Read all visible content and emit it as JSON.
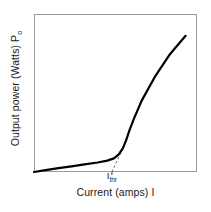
{
  "chart_data": {
    "type": "line",
    "title": "",
    "xlabel": "Current (amps) I",
    "ylabel_main": "Output power (Watts) P",
    "ylabel_sub": "o",
    "grid": false,
    "legend": null,
    "xlim": [
      0,
      1
    ],
    "ylim": [
      0,
      1
    ],
    "tick_labels": {
      "x": [],
      "y": []
    },
    "annotations": [
      {
        "name": "threshold-current",
        "text_main": "I",
        "text_sub": "thr",
        "x_norm": 0.478,
        "style": "dashed-extrapolation-to-x-axis"
      }
    ],
    "series": [
      {
        "name": "Laser diode L-I characteristic",
        "style": "solid",
        "color": "#000000",
        "linewidth": 2.2,
        "points_norm": [
          [
            0.0,
            0.0
          ],
          [
            0.07,
            0.012
          ],
          [
            0.15,
            0.024
          ],
          [
            0.23,
            0.036
          ],
          [
            0.31,
            0.048
          ],
          [
            0.39,
            0.06
          ],
          [
            0.45,
            0.072
          ],
          [
            0.49,
            0.086
          ],
          [
            0.52,
            0.112
          ],
          [
            0.545,
            0.15
          ],
          [
            0.565,
            0.2
          ],
          [
            0.585,
            0.262
          ],
          [
            0.61,
            0.33
          ],
          [
            0.66,
            0.45
          ],
          [
            0.74,
            0.6
          ],
          [
            0.83,
            0.74
          ],
          [
            0.93,
            0.862
          ]
        ]
      },
      {
        "name": "Threshold extrapolation",
        "style": "dashed",
        "color": "#555555",
        "linewidth": 1.0,
        "points_norm": [
          [
            0.478,
            0.0
          ],
          [
            0.545,
            0.15
          ],
          [
            0.575,
            0.23
          ]
        ]
      }
    ],
    "axes_frame": {
      "color": "#9a9a9a",
      "linewidth": 1.0,
      "sides": [
        "left",
        "right",
        "top",
        "bottom"
      ]
    }
  }
}
